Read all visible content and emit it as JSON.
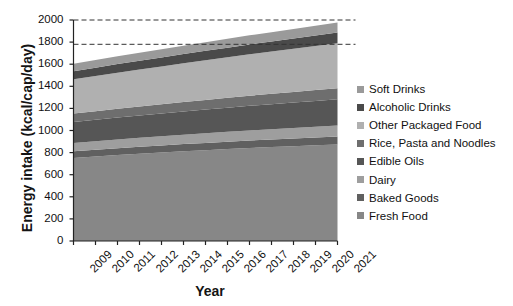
{
  "chart_data": {
    "type": "area",
    "stacked": true,
    "title": "",
    "xlabel": "Year",
    "ylabel": "Energy intake (kcal/cap/day)",
    "x": [
      2009,
      2010,
      2011,
      2012,
      2013,
      2014,
      2015,
      2016,
      2017,
      2018,
      2019,
      2020,
      2021
    ],
    "xticklabels": [
      "2009",
      "2010",
      "2011",
      "2012",
      "2013",
      "2014",
      "2015",
      "2016",
      "2017",
      "2018",
      "2019",
      "2020",
      "2021"
    ],
    "ylim": [
      0,
      2000
    ],
    "yticks": [
      0,
      200,
      400,
      600,
      800,
      1000,
      1200,
      1400,
      1600,
      1800,
      2000
    ],
    "yticklabels": [
      "0",
      "200",
      "400",
      "600",
      "800",
      "1000",
      "1200",
      "1400",
      "1600",
      "1800",
      "2000"
    ],
    "grid": false,
    "legend_position": "right",
    "reference_lines": [
      {
        "y": 2000,
        "style": "dashed"
      },
      {
        "y": 1780,
        "style": "dashed"
      }
    ],
    "stack_order_bottom_to_top": [
      "Fresh Food",
      "Baked Goods",
      "Dairy",
      "Edible Oils",
      "Rice, Pasta and Noodles",
      "Other Packaged Food",
      "Alcoholic Drinks",
      "Soft Drinks"
    ],
    "series": [
      {
        "name": "Fresh Food",
        "color": "#878787",
        "values": [
          752,
          765,
          778,
          790,
          800,
          812,
          822,
          832,
          842,
          850,
          858,
          866,
          874
        ]
      },
      {
        "name": "Baked Goods",
        "color": "#606060",
        "values": [
          60,
          61,
          62,
          63,
          64,
          65,
          66,
          67,
          68,
          69,
          70,
          71,
          72
        ]
      },
      {
        "name": "Dairy",
        "color": "#9e9e9e",
        "values": [
          75,
          77,
          79,
          81,
          83,
          85,
          87,
          89,
          91,
          93,
          95,
          97,
          99
        ]
      },
      {
        "name": "Edible Oils",
        "color": "#565656",
        "values": [
          190,
          194,
          198,
          202,
          206,
          210,
          214,
          218,
          222,
          226,
          230,
          234,
          238
        ]
      },
      {
        "name": "Rice, Pasta and Noodles",
        "color": "#6e6e6e",
        "values": [
          76,
          78,
          80,
          82,
          84,
          86,
          88,
          90,
          92,
          94,
          96,
          98,
          100
        ]
      },
      {
        "name": "Other Packaged Food",
        "color": "#b0b0b0",
        "values": [
          310,
          318,
          326,
          334,
          342,
          350,
          358,
          366,
          374,
          382,
          390,
          398,
          406
        ]
      },
      {
        "name": "Alcoholic Drinks",
        "color": "#4a4a4a",
        "values": [
          74,
          76,
          78,
          80,
          82,
          84,
          86,
          88,
          90,
          92,
          94,
          96,
          98
        ]
      },
      {
        "name": "Soft Drinks",
        "color": "#9a9a9a",
        "values": [
          66,
          68,
          70,
          72,
          74,
          76,
          78,
          80,
          82,
          84,
          86,
          88,
          90
        ]
      }
    ],
    "stack_totals": [
      1603,
      1637,
      1671,
      1704,
      1735,
      1768,
      1799,
      1830,
      1861,
      1890,
      1919,
      1948,
      1977
    ]
  },
  "legend": {
    "items": [
      {
        "label": "Soft Drinks",
        "color": "#9a9a9a"
      },
      {
        "label": "Alcoholic Drinks",
        "color": "#4a4a4a"
      },
      {
        "label": "Other Packaged Food",
        "color": "#b0b0b0"
      },
      {
        "label": "Rice, Pasta and Noodles",
        "color": "#6e6e6e"
      },
      {
        "label": "Edible Oils",
        "color": "#565656"
      },
      {
        "label": "Dairy",
        "color": "#9e9e9e"
      },
      {
        "label": "Baked Goods",
        "color": "#606060"
      },
      {
        "label": "Fresh Food",
        "color": "#878787"
      }
    ]
  },
  "axes": {
    "y_title": "Energy intake (kcal/cap/day)",
    "x_title": "Year"
  }
}
